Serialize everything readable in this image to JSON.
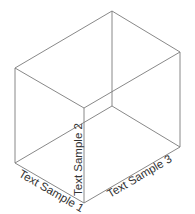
{
  "diagram": {
    "type": "isometric-box",
    "line_color": "#7a7a7a",
    "text_color": "#333333",
    "labels": {
      "axis1": "Text Sample 1",
      "axis2": "Text Sample 2",
      "axis3": "Text Sample 3"
    }
  }
}
